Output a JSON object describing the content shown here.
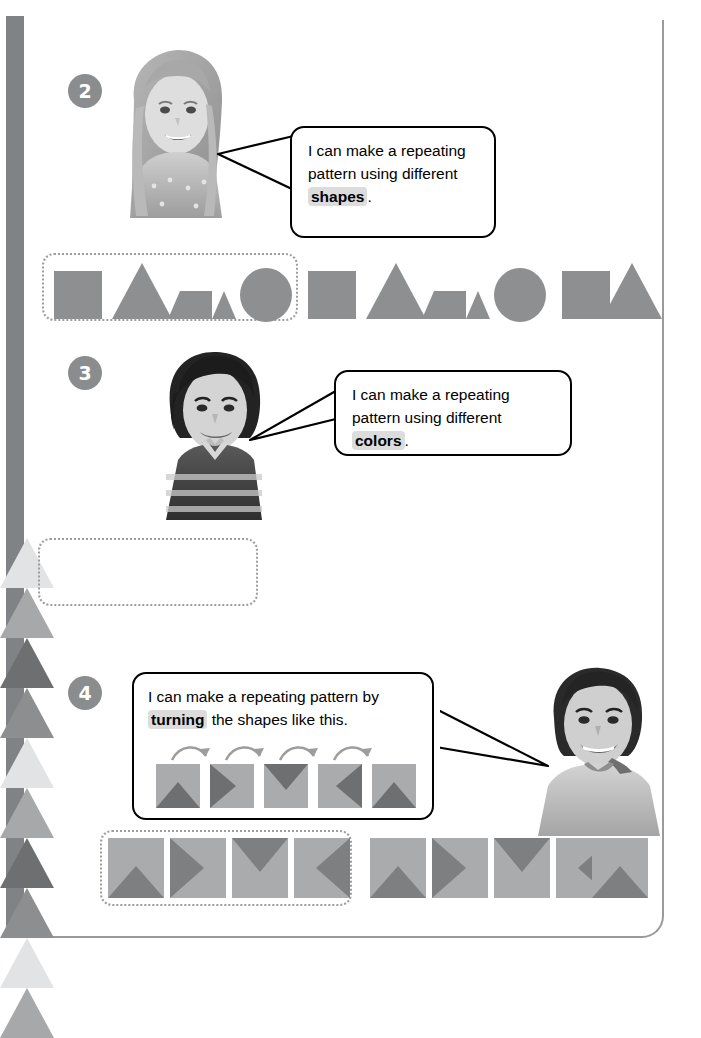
{
  "page": {
    "background": "#ffffff",
    "spine_color": "#808285",
    "frame_color": "#9a9a9a"
  },
  "sections": [
    {
      "number": "2",
      "badge_color": "#8a8c8e",
      "photo": "girl-smiling-photo",
      "bubble": {
        "text_before": "I can make a repeating pattern using different ",
        "highlight": "shapes",
        "text_after": "."
      },
      "pattern": {
        "type": "shapes",
        "core_unit_count": 4,
        "shape_color": "#8d8f91",
        "items": [
          "square",
          "triangle",
          "trapezoid",
          "circle",
          "square",
          "triangle",
          "trapezoid",
          "circle",
          "square",
          "triangle"
        ]
      }
    },
    {
      "number": "3",
      "badge_color": "#8a8c8e",
      "photo": "boy-dark-hair-striped-shirt-photo",
      "bubble": {
        "text_before": "I can make a repeating pattern using different ",
        "highlight": "colors",
        "text_after": "."
      },
      "pattern": {
        "type": "colors",
        "core_unit_count": 4,
        "items": [
          "#e2e3e4",
          "#a6a8aa",
          "#6d6f71",
          "#8c8e90",
          "#e2e3e4",
          "#a6a8aa",
          "#6d6f71",
          "#8c8e90",
          "#e2e3e4",
          "#a6a8aa"
        ]
      }
    },
    {
      "number": "4",
      "badge_color": "#8a8c8e",
      "photo": "boy-short-hair-photo",
      "bubble": {
        "text_before": "I can make a repeating pattern by ",
        "highlight": "turning",
        "text_after": " the shapes like this.",
        "example_tiles": [
          "up",
          "right",
          "down",
          "left",
          "up"
        ],
        "example_arrow_count": 4,
        "tile_base_color": "#a9abad",
        "tile_wedge_color": "#6d6f71"
      },
      "pattern": {
        "type": "turning",
        "core_unit_count": 4,
        "tile_base_color": "#a9abad",
        "tile_wedge_color": "#7d7f81",
        "items": [
          "up",
          "right",
          "down",
          "left",
          "up",
          "right",
          "down",
          "left",
          "up"
        ]
      }
    }
  ]
}
